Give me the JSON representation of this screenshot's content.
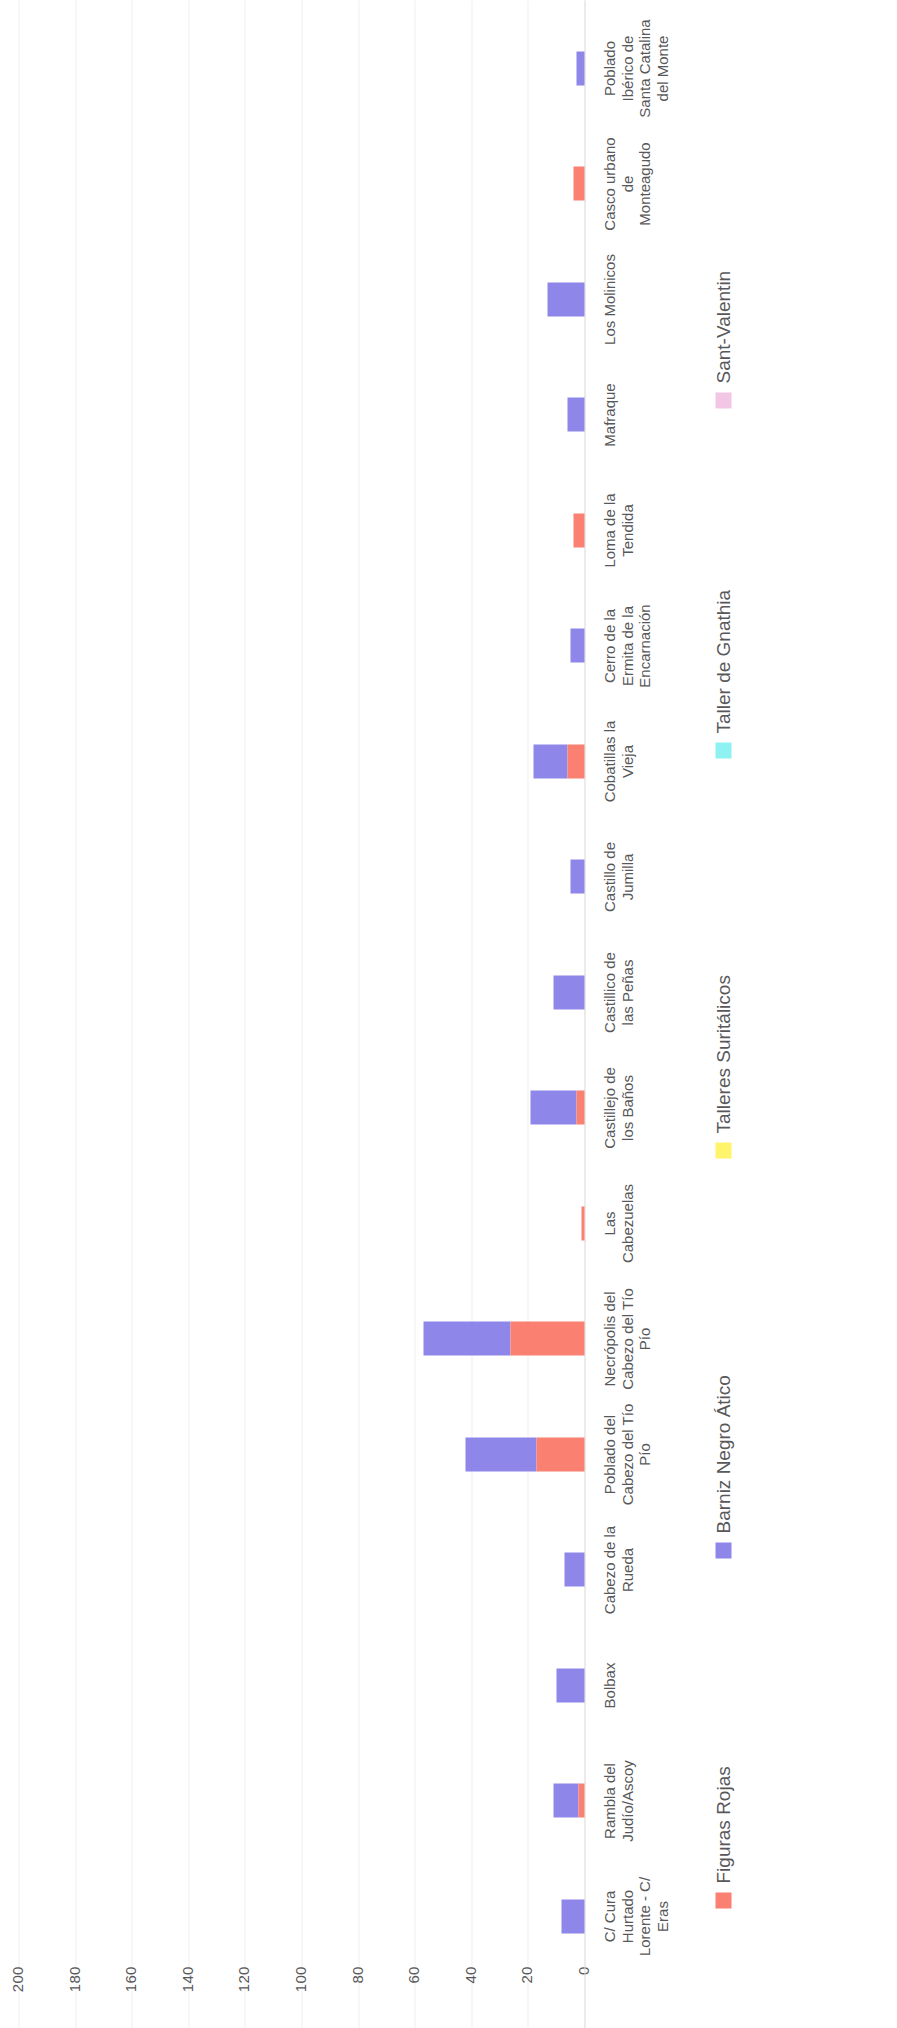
{
  "chart_data": {
    "type": "bar",
    "orientation": "vertical-stacked-rotated",
    "title": "",
    "subtitle": "",
    "xlabel": "",
    "ylabel": "",
    "ylim": [
      0,
      200
    ],
    "grid": true,
    "legend_position": "bottom",
    "ticks": [
      "0",
      "20",
      "40",
      "60",
      "80",
      "100",
      "120",
      "140",
      "160",
      "180",
      "200"
    ],
    "tick_values": [
      0,
      20,
      40,
      60,
      80,
      100,
      120,
      140,
      160,
      180,
      200
    ],
    "categories": [
      "C/ Cura Hurtado Lorente - C/ Eras",
      "Rambla del Judío/Ascoy",
      "Bolbax",
      "Cabezo de la Rueda",
      "Poblado del Cabezo del Tío Pío",
      "Necrópolis del Cabezo del Tío Pío",
      "Las Cabezuelas",
      "Castillejo de los Baños",
      "Castillico de las Peñas",
      "Castillo de Jumilla",
      "Cobatillas la Vieja",
      "Cerro de la Ermita de la Encarnación",
      "Loma de la Tendida",
      "Mafraque",
      "Los Molinicos",
      "Casco urbano de Monteagudo",
      "Poblado Ibérico de Santa Catalina del Monte"
    ],
    "series": [
      {
        "name": "Figuras Rojas",
        "color": "#FA8072",
        "values": [
          0,
          2,
          0,
          0,
          17,
          26,
          1,
          3,
          0,
          0,
          6,
          0,
          4,
          0,
          0,
          4,
          0
        ]
      },
      {
        "name": "Barniz Negro Ático",
        "color": "#8E86E8",
        "values": [
          8,
          9,
          10,
          7,
          25,
          31,
          0,
          16,
          11,
          5,
          12,
          5,
          0,
          6,
          13,
          0,
          3
        ]
      },
      {
        "name": "Talleres Suritálicos",
        "color": "#FFF46B",
        "values": [
          0,
          0,
          0,
          0,
          0,
          0,
          0,
          0,
          0,
          0,
          0,
          0,
          0,
          0,
          0,
          0,
          0
        ]
      },
      {
        "name": "Taller de Gnathia",
        "color": "#8FF2F2",
        "values": [
          0,
          0,
          0,
          0,
          0,
          0,
          0,
          0,
          0,
          0,
          0,
          0,
          0,
          0,
          0,
          0,
          0
        ]
      },
      {
        "name": "Sant-Valentin",
        "color": "#F3C6E6",
        "values": [
          0,
          0,
          0,
          0,
          0,
          0,
          0,
          0,
          0,
          0,
          0,
          0,
          0,
          0,
          0,
          0,
          0
        ]
      }
    ]
  },
  "legend": {
    "entries": [
      {
        "label": "Figuras Rojas",
        "color": "#FA8072"
      },
      {
        "label": "Barniz Negro Ático",
        "color": "#8E86E8"
      },
      {
        "label": "Talleres Suritálicos",
        "color": "#FFF46B"
      },
      {
        "label": "Taller de Gnathia",
        "color": "#8FF2F2"
      },
      {
        "label": "Sant-Valentin",
        "color": "#F3C6E6"
      }
    ]
  },
  "colors": {
    "grid": "#efefef",
    "text": "#58585a",
    "background": "#ffffff"
  }
}
